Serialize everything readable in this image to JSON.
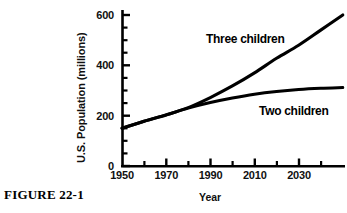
{
  "figure": {
    "caption": "FIGURE 22-1"
  },
  "chart_data": {
    "type": "line",
    "title": "",
    "xlabel": "Year",
    "ylabel": "U.S. Population (millions)",
    "xlim": [
      1950,
      2051
    ],
    "ylim": [
      0,
      640
    ],
    "grid": false,
    "legend": "inline-labels",
    "x_ticks": [
      1950,
      1970,
      1990,
      2010,
      2030
    ],
    "x_tick_labels": [
      "1950",
      "1970",
      "1990",
      "2010",
      "2030"
    ],
    "x_minor_ticks": [
      1960,
      1980,
      2000,
      2020,
      2040
    ],
    "y_ticks": [
      0,
      200,
      400,
      600
    ],
    "y_tick_labels": [
      "0",
      "200",
      "400",
      "600"
    ],
    "y_minor_ticks": [
      50,
      100,
      150,
      250,
      300,
      350,
      450,
      500,
      550
    ],
    "series": [
      {
        "name": "Three children",
        "label": "Three children",
        "color": "#000000",
        "x": [
          1950,
          1960,
          1970,
          1980,
          1990,
          2000,
          2010,
          2020,
          2030,
          2040,
          2050
        ],
        "values": [
          150,
          178,
          203,
          232,
          272,
          318,
          370,
          428,
          480,
          540,
          600
        ]
      },
      {
        "name": "Two children",
        "label": "Two children",
        "color": "#000000",
        "x": [
          1950,
          1960,
          1970,
          1980,
          1990,
          2000,
          2010,
          2020,
          2030,
          2040,
          2050
        ],
        "values": [
          150,
          178,
          203,
          230,
          252,
          270,
          285,
          296,
          304,
          309,
          312
        ]
      }
    ],
    "annotations": [
      {
        "text": "Three children",
        "x": 1985,
        "y": 500
      },
      {
        "text": "Two children",
        "x": 2012,
        "y": 245
      }
    ]
  }
}
